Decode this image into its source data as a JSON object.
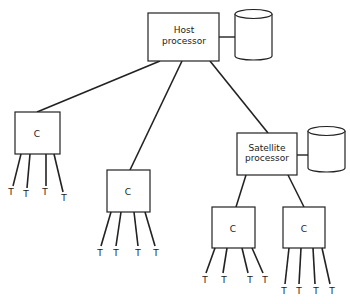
{
  "diagram": {
    "type": "hierarchical-processor-topology",
    "nodes": {
      "host": {
        "label_line1": "Host",
        "label_line2": "processor",
        "storage": "disk-cylinder"
      },
      "controller_left": {
        "label": "C"
      },
      "controller_middle": {
        "label": "C"
      },
      "satellite": {
        "label_line1": "Satellite",
        "label_line2": "processor",
        "storage": "disk-cylinder"
      },
      "controller_sat_left": {
        "label": "C"
      },
      "controller_sat_right": {
        "label": "C"
      }
    },
    "terminal_label": "T",
    "terminals_per_controller": 4,
    "edges": [
      [
        "host",
        "controller_left"
      ],
      [
        "host",
        "controller_middle"
      ],
      [
        "host",
        "satellite"
      ],
      [
        "satellite",
        "controller_sat_left"
      ],
      [
        "satellite",
        "controller_sat_right"
      ]
    ],
    "colors": {
      "stroke": "#222222",
      "background": "#ffffff"
    }
  }
}
